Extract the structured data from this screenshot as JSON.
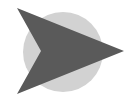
{
  "icon": {
    "name": "arrow-pointer-icon",
    "colors": {
      "background": "#ffffff",
      "circle": "#d2d2d2",
      "arrow": "#5a5a5a"
    },
    "circle": {
      "cx": 63,
      "cy": 52,
      "r": 40
    },
    "arrow_points": "17,8 124,51 17,94 41,51"
  }
}
